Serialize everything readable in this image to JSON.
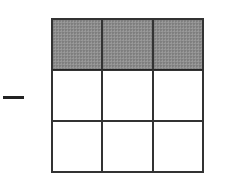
{
  "diagram": {
    "operator": {
      "symbol": "minus",
      "color": "#222222"
    },
    "grid": {
      "rows": 3,
      "columns": 3,
      "shaded_rows": [
        0
      ],
      "shaded_cells": 3,
      "total_cells": 9,
      "shade_color": "#8c8c8c",
      "line_color": "#333333",
      "cells": [
        {
          "row": 0,
          "col": 0,
          "shaded": true
        },
        {
          "row": 0,
          "col": 1,
          "shaded": true
        },
        {
          "row": 0,
          "col": 2,
          "shaded": true
        },
        {
          "row": 1,
          "col": 0,
          "shaded": false
        },
        {
          "row": 1,
          "col": 1,
          "shaded": false
        },
        {
          "row": 1,
          "col": 2,
          "shaded": false
        },
        {
          "row": 2,
          "col": 0,
          "shaded": false
        },
        {
          "row": 2,
          "col": 1,
          "shaded": false
        },
        {
          "row": 2,
          "col": 2,
          "shaded": false
        }
      ]
    }
  }
}
